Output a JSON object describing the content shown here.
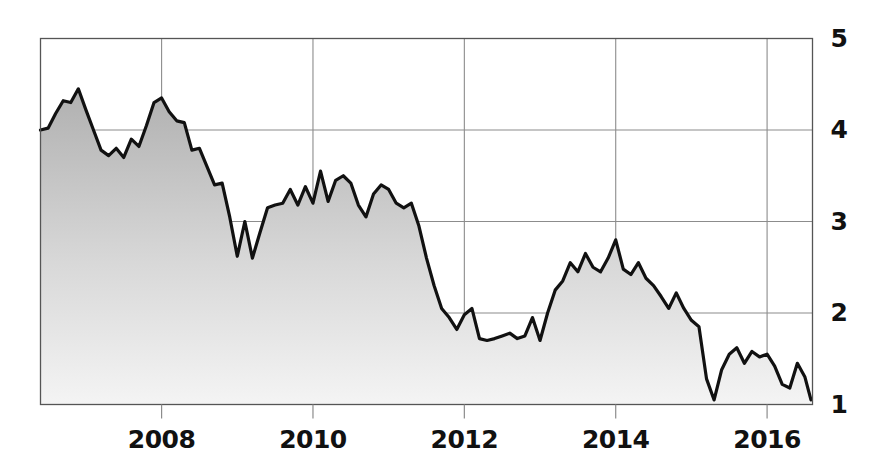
{
  "chart_data": {
    "type": "area",
    "title": "",
    "subtitle": "",
    "xlabel": "",
    "ylabel": "",
    "grid": true,
    "legend": null,
    "xlim": [
      2006.4,
      2016.6
    ],
    "ylim": [
      1,
      5
    ],
    "x_ticks": [
      2008,
      2010,
      2012,
      2014,
      2016
    ],
    "x_tick_labels": [
      "2008",
      "2010",
      "2012",
      "2014",
      "2016"
    ],
    "y_ticks": [
      1,
      2,
      3,
      4,
      5
    ],
    "y_tick_labels": [
      "1",
      "2",
      "3",
      "4",
      "5"
    ],
    "y_axis_side": "right",
    "series_name": "value",
    "line_color": "#111111",
    "fill_top_color": "#b0b0b0",
    "fill_bottom_color": "#f4f4f4",
    "grid_color": "#8c8c8c",
    "axis_color": "#555555",
    "x": [
      2006.4,
      2006.5,
      2006.6,
      2006.7,
      2006.8,
      2006.9,
      2007.0,
      2007.1,
      2007.2,
      2007.3,
      2007.4,
      2007.5,
      2007.6,
      2007.7,
      2007.8,
      2007.9,
      2008.0,
      2008.1,
      2008.2,
      2008.3,
      2008.4,
      2008.5,
      2008.6,
      2008.7,
      2008.8,
      2008.9,
      2009.0,
      2009.1,
      2009.2,
      2009.3,
      2009.4,
      2009.5,
      2009.6,
      2009.7,
      2009.8,
      2009.9,
      2010.0,
      2010.1,
      2010.2,
      2010.3,
      2010.4,
      2010.5,
      2010.6,
      2010.7,
      2010.8,
      2010.9,
      2011.0,
      2011.1,
      2011.2,
      2011.3,
      2011.4,
      2011.5,
      2011.6,
      2011.7,
      2011.8,
      2011.9,
      2012.0,
      2012.1,
      2012.2,
      2012.3,
      2012.4,
      2012.5,
      2012.6,
      2012.7,
      2012.8,
      2012.9,
      2013.0,
      2013.1,
      2013.2,
      2013.3,
      2013.4,
      2013.5,
      2013.6,
      2013.7,
      2013.8,
      2013.9,
      2014.0,
      2014.1,
      2014.2,
      2014.3,
      2014.4,
      2014.5,
      2014.6,
      2014.7,
      2014.8,
      2014.9,
      2015.0,
      2015.1,
      2015.2,
      2015.3,
      2015.4,
      2015.5,
      2015.6,
      2015.7,
      2015.8,
      2015.9,
      2016.0,
      2016.1,
      2016.2,
      2016.3,
      2016.4,
      2016.5,
      2016.58
    ],
    "values": [
      4.0,
      4.02,
      4.18,
      4.32,
      4.3,
      4.45,
      4.22,
      4.0,
      3.78,
      3.72,
      3.8,
      3.7,
      3.9,
      3.82,
      4.05,
      4.3,
      4.35,
      4.2,
      4.1,
      4.08,
      3.78,
      3.8,
      3.6,
      3.4,
      3.42,
      3.05,
      2.62,
      3.0,
      2.6,
      2.88,
      3.15,
      3.18,
      3.2,
      3.35,
      3.18,
      3.38,
      3.2,
      3.55,
      3.22,
      3.45,
      3.5,
      3.42,
      3.18,
      3.05,
      3.3,
      3.4,
      3.35,
      3.2,
      3.15,
      3.2,
      2.95,
      2.6,
      2.3,
      2.05,
      1.95,
      1.82,
      1.98,
      2.05,
      1.72,
      1.7,
      1.72,
      1.75,
      1.78,
      1.72,
      1.75,
      1.95,
      1.7,
      2.0,
      2.25,
      2.35,
      2.55,
      2.45,
      2.65,
      2.5,
      2.45,
      2.6,
      2.8,
      2.48,
      2.42,
      2.55,
      2.38,
      2.3,
      2.18,
      2.05,
      2.22,
      2.05,
      1.92,
      1.85,
      1.28,
      1.05,
      1.38,
      1.55,
      1.62,
      1.45,
      1.58,
      1.52,
      1.55,
      1.42,
      1.22,
      1.18,
      1.45,
      1.3,
      1.05
    ]
  }
}
